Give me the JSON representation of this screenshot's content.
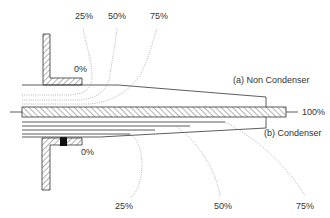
{
  "diagram": {
    "top_percent_labels": [
      "25%",
      "50%",
      "75%"
    ],
    "top_zero_label": "0%",
    "bottom_zero_label": "0%",
    "bottom_percent_labels": [
      "25%",
      "50%",
      "75%"
    ],
    "conductor_label": "100%",
    "label_a": "(a) Non Condenser",
    "label_b": "(b) Condenser",
    "colors": {
      "stroke": "#333333",
      "dotted": "#888888",
      "hatch": "#444444",
      "seal": "#111111"
    }
  }
}
